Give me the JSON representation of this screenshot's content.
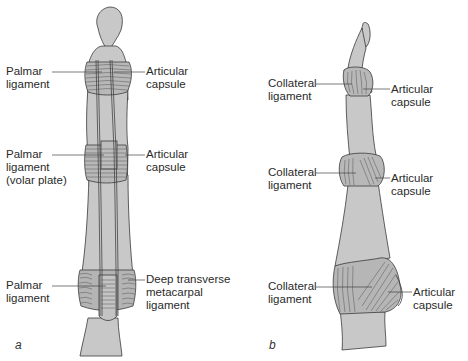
{
  "figure": {
    "panels": [
      {
        "id": "a",
        "view": "palmar",
        "letter": "a",
        "labels": {
          "left": [
            {
              "lines": [
                "Palmar",
                "ligament"
              ]
            },
            {
              "lines": [
                "Palmar",
                "ligament",
                "(volar plate)"
              ]
            },
            {
              "lines": [
                "Palmar",
                "ligament"
              ]
            }
          ],
          "right": [
            {
              "lines": [
                "Articular",
                "capsule"
              ]
            },
            {
              "lines": [
                "Articular",
                "capsule"
              ]
            },
            {
              "lines": [
                "Deep transverse",
                "metacarpal",
                "ligament"
              ]
            }
          ]
        }
      },
      {
        "id": "b",
        "view": "lateral",
        "letter": "b",
        "labels": {
          "left": [
            {
              "lines": [
                "Collateral",
                "ligament"
              ]
            },
            {
              "lines": [
                "Collateral",
                "ligament"
              ]
            },
            {
              "lines": [
                "Collateral",
                "ligament"
              ]
            }
          ],
          "right": [
            {
              "lines": [
                "Articular",
                "capsule"
              ]
            },
            {
              "lines": [
                "Articular",
                "capsule"
              ]
            },
            {
              "lines": [
                "Articular",
                "capsule"
              ]
            }
          ]
        }
      }
    ],
    "colors": {
      "bone_fill": "#c8c8c8",
      "outline": "#3a3a3a",
      "ligament_fill": "#b4b4b4",
      "leader_line": "#444444",
      "text": "#2a2a2a"
    }
  }
}
